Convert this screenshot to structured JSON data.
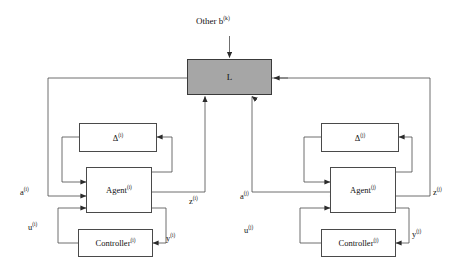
{
  "diagram": {
    "colors": {
      "hub_fill": "#a6a6a6",
      "block_border": "#4a4a4a",
      "wire": "#4a4a4a",
      "text": "#111111",
      "background": "#ffffff"
    },
    "external_input": {
      "label_text": "Other b",
      "label_sup": "(k)",
      "target": "L"
    },
    "hub": {
      "label": "L",
      "name": "coupling-block-L"
    },
    "subsystems": [
      {
        "id": "i",
        "side": "left",
        "blocks": [
          {
            "name": "delta-block",
            "text": "Δ",
            "sup": "(i)"
          },
          {
            "name": "agent-block",
            "text": "Agent",
            "sup": "(i)"
          },
          {
            "name": "controller-block",
            "text": "Controller",
            "sup": "(i)"
          }
        ],
        "signals": [
          {
            "name": "input-a",
            "text": "a",
            "sup": "(i)"
          },
          {
            "name": "input-u",
            "text": "u",
            "sup": "(i)"
          },
          {
            "name": "output-z",
            "text": "z",
            "sup": "(i)"
          },
          {
            "name": "output-y",
            "text": "y",
            "sup": "(i)"
          }
        ]
      },
      {
        "id": "j",
        "side": "right",
        "blocks": [
          {
            "name": "delta-block",
            "text": "Δ",
            "sup": "(j)"
          },
          {
            "name": "agent-block",
            "text": "Agent",
            "sup": "(j)"
          },
          {
            "name": "controller-block",
            "text": "Controller",
            "sup": "(j)"
          }
        ],
        "signals": [
          {
            "name": "input-a",
            "text": "a",
            "sup": "(j)"
          },
          {
            "name": "input-u",
            "text": "u",
            "sup": "(j)"
          },
          {
            "name": "output-z",
            "text": "z",
            "sup": "(j)"
          },
          {
            "name": "output-y",
            "text": "y",
            "sup": "(j)"
          }
        ]
      }
    ]
  }
}
